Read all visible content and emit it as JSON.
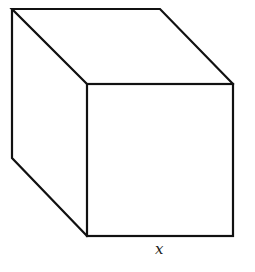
{
  "diagram": {
    "type": "cube",
    "edge_label": "x",
    "stroke_color": "#111111",
    "background": "#ffffff",
    "vertices": {
      "back_top_left": [
        12,
        9
      ],
      "back_top_right": [
        160,
        9
      ],
      "back_bottom_left": [
        12,
        158
      ],
      "front_top_left": [
        87,
        84
      ],
      "front_top_right": [
        233,
        84
      ],
      "front_bottom_left": [
        87,
        236
      ],
      "front_bottom_right": [
        233,
        236
      ]
    }
  }
}
